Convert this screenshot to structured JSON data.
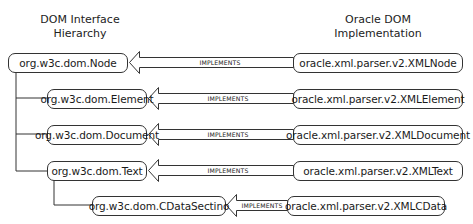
{
  "headings": {
    "left": [
      "DOM Interface",
      "Hierarchy"
    ],
    "right": [
      "Oracle DOM",
      "Implementation"
    ]
  },
  "relation_label": "IMPLEMENTS",
  "rows": [
    {
      "interface": "org.w3c.dom.Node",
      "implementation": "oracle.xml.parser.v2.XMLNode",
      "parent": null
    },
    {
      "interface": "org.w3c.dom.Element",
      "implementation": "oracle.xml.parser.v2.XMLElement",
      "parent": "org.w3c.dom.Node"
    },
    {
      "interface": "org.w3c.dom.Document",
      "implementation": "oracle.xml.parser.v2.XMLDocument",
      "parent": "org.w3c.dom.Node"
    },
    {
      "interface": "org.w3c.dom.Text",
      "implementation": "oracle.xml.parser.v2.XMLText",
      "parent": "org.w3c.dom.Node"
    },
    {
      "interface": "org.w3c.dom.CDataSectino",
      "implementation": "oracle.xml.parser.v2.XMLCData",
      "parent": "org.w3c.dom.Text"
    }
  ]
}
